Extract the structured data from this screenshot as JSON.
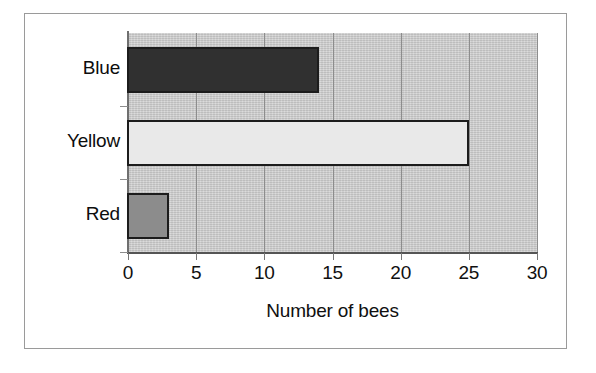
{
  "chart_data": {
    "type": "bar",
    "orientation": "horizontal",
    "title": "",
    "xlabel": "Number of bees",
    "ylabel": "",
    "categories": [
      "Red",
      "Yellow",
      "Blue"
    ],
    "values": [
      3,
      25,
      14
    ],
    "xlim": [
      0,
      30
    ],
    "xticks": [
      0,
      5,
      10,
      15,
      20,
      25,
      30
    ],
    "xtick_labels": [
      "0",
      "5",
      "10",
      "15",
      "20",
      "25",
      "30"
    ],
    "grid": true,
    "legend": "none",
    "bars": [
      {
        "category": "Blue",
        "value": 14,
        "fill": "#303030",
        "edge": "#1c1c1c"
      },
      {
        "category": "Yellow",
        "value": 25,
        "fill": "#e9e9e9",
        "edge": "#1c1c1c"
      },
      {
        "category": "Red",
        "value": 3,
        "fill": "#8c8c8c",
        "edge": "#1c1c1c"
      }
    ],
    "plot_background": "#cfcfcf",
    "gridline_color": "#8d8d8d",
    "axis_color": "#555555",
    "text_color": "#101010"
  }
}
